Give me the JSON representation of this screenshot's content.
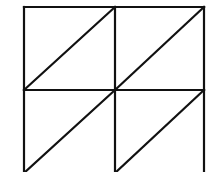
{
  "diagram": {
    "stroke_color": "#111111",
    "background_color": "#ffffff",
    "stroke_width": 2.2,
    "grid": {
      "x": [
        24,
        115,
        204
      ],
      "y": [
        7,
        90,
        173
      ]
    },
    "diagonals": [
      {
        "from": [
          24,
          90
        ],
        "to": [
          115,
          7
        ]
      },
      {
        "from": [
          115,
          90
        ],
        "to": [
          204,
          7
        ]
      },
      {
        "from": [
          24,
          173
        ],
        "to": [
          115,
          90
        ]
      },
      {
        "from": [
          115,
          173
        ],
        "to": [
          204,
          90
        ]
      }
    ]
  }
}
